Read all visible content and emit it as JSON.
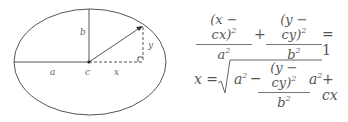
{
  "diagram": {
    "ellipse": {
      "cx": 90,
      "cy": 62,
      "rx": 76,
      "ry": 53,
      "stroke": "#555555"
    },
    "center_point": {
      "x": 89,
      "y": 62
    },
    "ellipse_point": {
      "x": 143,
      "y": 26
    },
    "labels": {
      "a": "a",
      "b": "b",
      "c": "c",
      "x": "x",
      "y": "y"
    }
  },
  "equations": {
    "eq1": {
      "term1_num": "(x − cx)",
      "term1_num_exp": "2",
      "term1_den": "a",
      "term1_den_exp": "2",
      "plus": "+",
      "term2_num": "(y − cy)",
      "term2_num_exp": "2",
      "term2_den": "b",
      "term2_den_exp": "2",
      "equals": "= 1"
    },
    "eq2": {
      "lhs": "x =",
      "a_sq": "a",
      "a_sq_exp": "2",
      "minus": "−",
      "frac_num": "(y − cy)",
      "frac_num_exp": "2",
      "frac_den": "b",
      "frac_den_exp": "2",
      "a_sq2": "a",
      "a_sq2_exp": "2",
      "tail": "+ cx"
    }
  }
}
